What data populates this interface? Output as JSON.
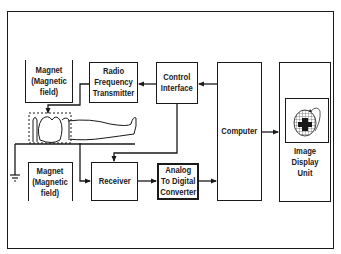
{
  "diagram": {
    "blocks": {
      "magnet_top": {
        "label": "Magnet\n(Magnetic\nfield)"
      },
      "rf_transmitter": {
        "label": "Radio\nFrequency\nTransmitter"
      },
      "control_interface": {
        "label": "Control\nInterface"
      },
      "computer": {
        "label": "Computer"
      },
      "image_display": {
        "label": "Image\nDisplay\nUnit"
      },
      "magnet_bottom": {
        "label": "Magnet\n(Magnetic\nfield)"
      },
      "receiver": {
        "label": "Receiver"
      },
      "adc": {
        "label": "Analog\nTo Digital\nConverter"
      }
    },
    "connections": [
      {
        "from": "control_interface",
        "to": "rf_transmitter"
      },
      {
        "from": "computer",
        "to": "control_interface"
      },
      {
        "from": "rf_transmitter",
        "to": "patient_coil"
      },
      {
        "from": "patient_coil",
        "to": "receiver"
      },
      {
        "from": "control_interface",
        "to": "receiver"
      },
      {
        "from": "receiver",
        "to": "adc"
      },
      {
        "from": "adc",
        "to": "computer"
      },
      {
        "from": "computer",
        "to": "image_display"
      },
      {
        "from": "patient_coil",
        "to": "ground"
      }
    ],
    "icons": {
      "patient": "patient-figure-icon",
      "ground": "ground-icon",
      "display_screen": "brain-scan-icon"
    },
    "colors": {
      "line": "#1a1a1a",
      "background": "#ffffff"
    }
  }
}
